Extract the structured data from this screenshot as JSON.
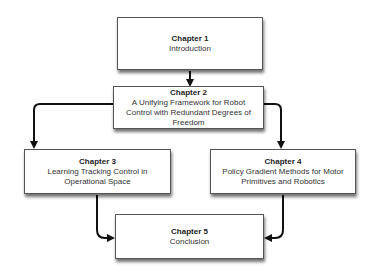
{
  "diagram": {
    "type": "flowchart",
    "nodes": [
      {
        "id": "ch1",
        "title": "Chapter 1",
        "subtitle": "Introduction"
      },
      {
        "id": "ch2",
        "title": "Chapter 2",
        "subtitle": "A Unifying Framework for Robot Control with Redundant Degrees of Freedom"
      },
      {
        "id": "ch3",
        "title": "Chapter 3",
        "subtitle": "Learning Tracking Control in Operational Space"
      },
      {
        "id": "ch4",
        "title": "Chapter 4",
        "subtitle": "Policy Gradient Methods for Motor Primitives and Robotics"
      },
      {
        "id": "ch5",
        "title": "Chapter 5",
        "subtitle": "Conclusion"
      }
    ],
    "edges": [
      {
        "from": "ch1",
        "to": "ch2"
      },
      {
        "from": "ch2",
        "to": "ch3"
      },
      {
        "from": "ch2",
        "to": "ch4"
      },
      {
        "from": "ch3",
        "to": "ch5"
      },
      {
        "from": "ch4",
        "to": "ch5"
      }
    ]
  }
}
